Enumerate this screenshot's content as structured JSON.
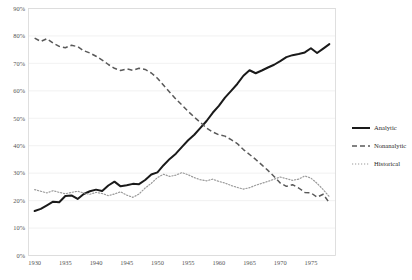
{
  "chart_data": {
    "type": "line",
    "title": "",
    "subtitle": "",
    "xlabel": "",
    "ylabel": "",
    "xlim": [
      1929,
      1979
    ],
    "ylim": [
      0,
      90
    ],
    "grid": true,
    "legend_position": "right",
    "x_tick_labels": [
      "1930",
      "1935",
      "1940",
      "1945",
      "1950",
      "1955",
      "1960",
      "1965",
      "1970",
      "1975"
    ],
    "x_tick_values": [
      1930,
      1935,
      1940,
      1945,
      1950,
      1955,
      1960,
      1965,
      1970,
      1975
    ],
    "y_tick_labels": [
      "0%",
      "10%",
      "20%",
      "30%",
      "40%",
      "50%",
      "60%",
      "70%",
      "80%",
      "90%"
    ],
    "y_tick_values": [
      0,
      10,
      20,
      30,
      40,
      50,
      60,
      70,
      80,
      90
    ],
    "x": [
      1930,
      1931,
      1932,
      1933,
      1934,
      1935,
      1936,
      1937,
      1938,
      1939,
      1940,
      1941,
      1942,
      1943,
      1944,
      1945,
      1946,
      1947,
      1948,
      1949,
      1950,
      1951,
      1952,
      1953,
      1954,
      1955,
      1956,
      1957,
      1958,
      1959,
      1960,
      1961,
      1962,
      1963,
      1964,
      1965,
      1966,
      1967,
      1968,
      1969,
      1970,
      1971,
      1972,
      1973,
      1974,
      1975,
      1976,
      1977,
      1978
    ],
    "series": [
      {
        "name": "Analytic",
        "style": "solid",
        "color": "#1a1a1a",
        "values": [
          16.2,
          17.0,
          18.3,
          19.6,
          19.4,
          21.7,
          21.9,
          20.6,
          22.4,
          23.4,
          24.0,
          23.5,
          25.5,
          26.9,
          25.2,
          25.6,
          26.1,
          26.0,
          27.5,
          29.5,
          30.3,
          32.9,
          35.2,
          37.1,
          39.6,
          42.0,
          44.0,
          46.5,
          49.0,
          52.0,
          54.5,
          57.5,
          60.0,
          62.5,
          65.5,
          67.5,
          66.4,
          67.4,
          68.5,
          69.5,
          70.8,
          72.3,
          73.0,
          73.4,
          74.0,
          75.5,
          73.8,
          75.4,
          77.0
        ]
      },
      {
        "name": "Nonanalytic",
        "style": "dashed",
        "color": "#595959",
        "values": [
          79.2,
          78.0,
          79.0,
          77.4,
          76.2,
          75.7,
          76.6,
          76.1,
          74.6,
          73.8,
          72.6,
          71.2,
          69.6,
          68.2,
          67.4,
          68.0,
          67.5,
          68.2,
          67.8,
          66.5,
          64.6,
          62.0,
          59.5,
          57.0,
          54.8,
          52.5,
          50.4,
          48.5,
          46.4,
          45.0,
          44.0,
          43.5,
          42.2,
          40.8,
          38.6,
          36.8,
          35.0,
          33.0,
          31.0,
          28.8,
          26.4,
          25.2,
          25.8,
          24.6,
          23.0,
          22.8,
          21.3,
          22.3,
          19.2
        ]
      },
      {
        "name": "Historical",
        "style": "dotted",
        "color": "#9a9a9a",
        "values": [
          24.0,
          23.4,
          22.8,
          23.6,
          23.0,
          22.5,
          23.0,
          23.4,
          22.8,
          22.3,
          23.0,
          22.6,
          21.8,
          22.4,
          23.2,
          22.0,
          21.2,
          22.4,
          24.6,
          26.3,
          28.4,
          29.6,
          28.8,
          29.3,
          30.2,
          29.4,
          28.4,
          27.6,
          27.2,
          27.8,
          27.0,
          26.4,
          25.5,
          24.8,
          24.2,
          24.7,
          25.6,
          26.3,
          27.0,
          27.8,
          28.6,
          28.0,
          27.4,
          27.8,
          29.0,
          28.2,
          26.3,
          24.0,
          21.4
        ]
      }
    ]
  },
  "legend": {
    "items": [
      {
        "label": "Analytic"
      },
      {
        "label": "Nonanalytic"
      },
      {
        "label": "Historical"
      }
    ]
  }
}
